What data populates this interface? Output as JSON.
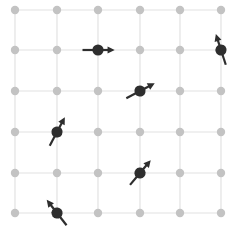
{
  "figure": {
    "name": "spin-lattice-diagram",
    "width": 235,
    "height": 235,
    "background_color": "#ffffff"
  },
  "lattice": {
    "rows": 6,
    "cols": 6,
    "x_positions": [
      15,
      57,
      98,
      140,
      180,
      221
    ],
    "y_positions": [
      10,
      50,
      91,
      132,
      173,
      213
    ],
    "site_dot_color": "#c3c3c3",
    "site_dot_radius": 4.2,
    "bond_line_color": "#e2e2e2",
    "bond_line_width": 1.2
  },
  "spins": {
    "color": "#2e2e2e",
    "head_radius": 5.6,
    "shaft_length": 15.5,
    "shaft_width": 2.2,
    "arrow_head_size": 4.6,
    "items": [
      {
        "id": "spin-r2c3",
        "row": 1,
        "col": 2,
        "cx": 98,
        "cy": 50,
        "angle_deg": 0,
        "direction": "right"
      },
      {
        "id": "spin-r2c6",
        "row": 1,
        "col": 5,
        "cx": 221,
        "cy": 50,
        "angle_deg": 108,
        "direction": "up-left"
      },
      {
        "id": "spin-r3c4",
        "row": 2,
        "col": 3,
        "cx": 140,
        "cy": 91,
        "angle_deg": 28,
        "direction": "up-right"
      },
      {
        "id": "spin-r4c2",
        "row": 3,
        "col": 1,
        "cx": 57,
        "cy": 132,
        "angle_deg": 62,
        "direction": "up-right-steep"
      },
      {
        "id": "spin-r5c4",
        "row": 4,
        "col": 3,
        "cx": 140,
        "cy": 173,
        "angle_deg": 50,
        "direction": "up-right"
      },
      {
        "id": "spin-r6c2",
        "row": 5,
        "col": 1,
        "cx": 57,
        "cy": 213,
        "angle_deg": 128,
        "direction": "up-left"
      }
    ]
  }
}
